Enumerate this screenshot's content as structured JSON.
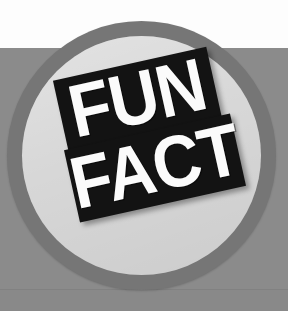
{
  "graphic": {
    "kind": "fun-fact-badge",
    "alt_text": "FUN FACT",
    "background": {
      "top_band_color": "#fdfdfd",
      "lower_band_color": "#8b8b8b",
      "hairline_color": "#7d7d7d"
    },
    "badge": {
      "ring_color": "#767676",
      "inner_color": "#d7d7d7",
      "shape": "circle"
    },
    "banners": [
      {
        "text": "FUN",
        "background_color": "#131313",
        "text_color": "#fbfbfb",
        "rotation_deg": -12.5
      },
      {
        "text": "FACT",
        "background_color": "#131313",
        "text_color": "#fbfbfb",
        "rotation_deg": -12.5
      }
    ]
  }
}
